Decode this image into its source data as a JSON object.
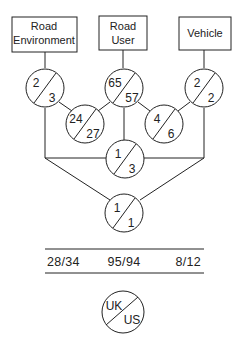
{
  "diagram": {
    "boxes": [
      {
        "id": "road-environment",
        "lines": [
          "Road",
          "Environment"
        ]
      },
      {
        "id": "road-user",
        "lines": [
          "Road",
          "User"
        ]
      },
      {
        "id": "vehicle",
        "lines": [
          "Vehicle"
        ]
      }
    ],
    "circles": [
      {
        "id": "road-environment-only",
        "top": "2",
        "bottom": "3"
      },
      {
        "id": "road-user-only",
        "top": "65",
        "bottom": "57"
      },
      {
        "id": "vehicle-only",
        "top": "2",
        "bottom": "2"
      },
      {
        "id": "environment-user",
        "top": "24",
        "bottom": "27"
      },
      {
        "id": "user-vehicle",
        "top": "4",
        "bottom": "6"
      },
      {
        "id": "environment-vehicle",
        "top": "1",
        "bottom": "3"
      },
      {
        "id": "all-three",
        "top": "1",
        "bottom": "1"
      }
    ],
    "totals": [
      "28/34",
      "95/94",
      "8/12"
    ],
    "legend": {
      "top": "UK",
      "bottom": "US"
    }
  }
}
